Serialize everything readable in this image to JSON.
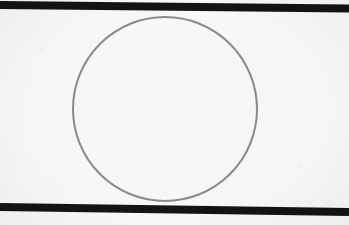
{
  "figure": {
    "kind": "geometry-diagram",
    "canvas": {
      "width": 349,
      "height": 225,
      "background_color": "#f7f7f5"
    },
    "elements": {
      "top_line": {
        "label": "top-tangent-line",
        "color": "#141414",
        "thickness": 8,
        "x1": 0,
        "y1": 5,
        "x2": 349,
        "y2": 8.5
      },
      "bottom_line": {
        "label": "bottom-tangent-line",
        "color": "#141414",
        "thickness": 8,
        "x1": 0,
        "y1": 207,
        "x2": 349,
        "y2": 212
      },
      "circle": {
        "label": "inscribed-circle",
        "stroke_color": "#8a8a8a",
        "stroke_width": 2,
        "fill": "none",
        "center_x": 165,
        "center_y": 109,
        "radius": 92
      }
    }
  },
  "chart_data": {
    "type": "scatter",
    "title": "",
    "xlabel": "",
    "ylabel": "",
    "grid": false,
    "legend": "none",
    "xlim": [
      0,
      349
    ],
    "ylim": [
      225,
      0
    ],
    "shapes": [
      {
        "name": "top-tangent-line",
        "type": "line",
        "points": [
          [
            0,
            5
          ],
          [
            349,
            8.5
          ]
        ],
        "color": "#141414",
        "width": 8
      },
      {
        "name": "inscribed-circle",
        "type": "circle",
        "center": [
          165,
          109
        ],
        "radius": 92,
        "stroke": "#8a8a8a",
        "stroke_width": 2,
        "fill": "none"
      },
      {
        "name": "bottom-tangent-line",
        "type": "line",
        "points": [
          [
            0,
            207
          ],
          [
            349,
            212
          ]
        ],
        "color": "#141414",
        "width": 8
      }
    ]
  }
}
